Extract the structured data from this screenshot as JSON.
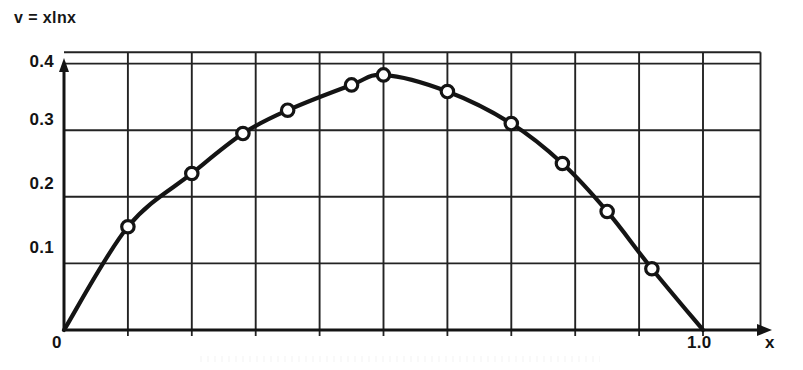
{
  "figure": {
    "function_label": "v = xlnx",
    "background_color": "#ffffff",
    "ink_color": "#141414"
  },
  "axes": {
    "x_axis_name": "x",
    "y_axis_name": "",
    "origin_label": "0",
    "x_tick_labels": [
      "1.0"
    ],
    "y_tick_labels": [
      "0.1",
      "0.2",
      "0.3",
      "0.4"
    ]
  },
  "chart_data": {
    "type": "line",
    "title": "v = xlnx",
    "xlabel": "x",
    "ylabel": "v",
    "xlim": [
      0,
      1.1
    ],
    "ylim": [
      0,
      0.42
    ],
    "grid": true,
    "legend": "none",
    "x_ticks": [
      1.0
    ],
    "x_tick_labels": [
      "1.0"
    ],
    "y_ticks": [
      0.1,
      0.2,
      0.3,
      0.4
    ],
    "y_tick_labels": [
      "0.1",
      "0.2",
      "0.3",
      "0.4"
    ],
    "x_gridlines": [
      0.1,
      0.2,
      0.3,
      0.4,
      0.5,
      0.6,
      0.7,
      0.8,
      0.9,
      1.0
    ],
    "y_gridlines": [
      0.1,
      0.2,
      0.3,
      0.4
    ],
    "marker": "open-circle",
    "series": [
      {
        "name": "v = xlnx",
        "x": [
          0.0,
          0.1,
          0.2,
          0.28,
          0.35,
          0.45,
          0.5,
          0.6,
          0.7,
          0.78,
          0.85,
          0.92,
          1.0
        ],
        "y": [
          0.0,
          0.155,
          0.235,
          0.295,
          0.33,
          0.368,
          0.383,
          0.358,
          0.31,
          0.25,
          0.178,
          0.092,
          0.0
        ],
        "marker_points": [
          {
            "x": 0.1,
            "y": 0.155
          },
          {
            "x": 0.2,
            "y": 0.235
          },
          {
            "x": 0.28,
            "y": 0.295
          },
          {
            "x": 0.35,
            "y": 0.33
          },
          {
            "x": 0.45,
            "y": 0.368
          },
          {
            "x": 0.5,
            "y": 0.383
          },
          {
            "x": 0.6,
            "y": 0.358
          },
          {
            "x": 0.7,
            "y": 0.31
          },
          {
            "x": 0.78,
            "y": 0.25
          },
          {
            "x": 0.85,
            "y": 0.178
          },
          {
            "x": 0.92,
            "y": 0.092
          }
        ]
      }
    ]
  }
}
